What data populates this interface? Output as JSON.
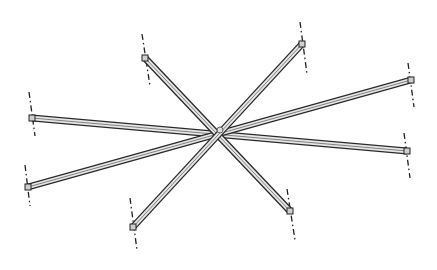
{
  "diagram": {
    "type": "technical-line-drawing",
    "canvas": {
      "width": 437,
      "height": 270,
      "background": "#ffffff"
    },
    "center": {
      "x": 220,
      "y": 130
    },
    "beam_style": {
      "outline_color": "#2a2a2a",
      "fill_color": "#e6e6e6",
      "groove_color": "#555555",
      "width": 7
    },
    "beams": [
      {
        "id": "beam-1",
        "from": {
          "x": 32,
          "y": 118
        },
        "to": {
          "x": 407,
          "y": 151
        }
      },
      {
        "id": "beam-2",
        "from": {
          "x": 28,
          "y": 187
        },
        "to": {
          "x": 411,
          "y": 80
        }
      },
      {
        "id": "beam-3",
        "from": {
          "x": 145,
          "y": 58
        },
        "to": {
          "x": 290,
          "y": 211
        }
      },
      {
        "id": "beam-4",
        "from": {
          "x": 133,
          "y": 227
        },
        "to": {
          "x": 302,
          "y": 44
        }
      }
    ],
    "centerlines": [
      {
        "id": "cl-left",
        "from": {
          "x": 29,
          "y": 92
        },
        "to": {
          "x": 35,
          "y": 136
        }
      },
      {
        "id": "cl-right-lower",
        "from": {
          "x": 404,
          "y": 133
        },
        "to": {
          "x": 410,
          "y": 178
        }
      },
      {
        "id": "cl-lower-left",
        "from": {
          "x": 25,
          "y": 165
        },
        "to": {
          "x": 30,
          "y": 206
        }
      },
      {
        "id": "cl-right-upper",
        "from": {
          "x": 408,
          "y": 63
        },
        "to": {
          "x": 414,
          "y": 107
        }
      },
      {
        "id": "cl-upper-left",
        "from": {
          "x": 142,
          "y": 34
        },
        "to": {
          "x": 150,
          "y": 86
        }
      },
      {
        "id": "cl-lower-right",
        "from": {
          "x": 287,
          "y": 189
        },
        "to": {
          "x": 295,
          "y": 240
        }
      },
      {
        "id": "cl-bottom",
        "from": {
          "x": 130,
          "y": 198
        },
        "to": {
          "x": 137,
          "y": 250
        }
      },
      {
        "id": "cl-upper-right",
        "from": {
          "x": 300,
          "y": 22
        },
        "to": {
          "x": 307,
          "y": 74
        }
      }
    ],
    "labels": []
  }
}
